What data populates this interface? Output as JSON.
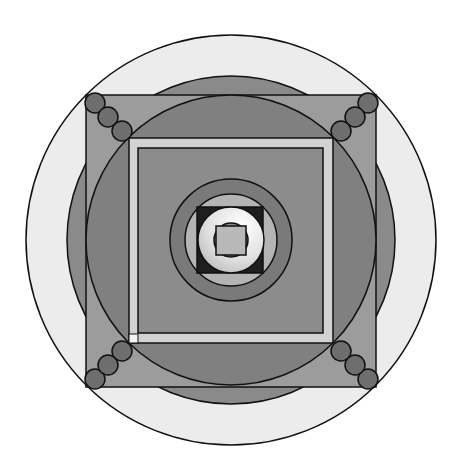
{
  "diagram": {
    "title": "",
    "type": "concentric-geometric-mandala",
    "center": [
      231,
      240
    ],
    "colors": {
      "background": "#ffffff",
      "outer_circle": "#ececec",
      "mid_circle": "#8a8a8a",
      "outer_square": "#9c9c9c",
      "inner_circle": "#808080",
      "frame": "#d2d2d2",
      "frame_inner": "#8c8c8c",
      "ring": "#7a7a7a",
      "light_circle": "#b4b4b4",
      "dark_square": "#1e1e1e",
      "white_ring": "#e6e6e6",
      "core_circle": "#8a8a8a",
      "core_square": "#b8b8b8",
      "corner_dots": "#6e6e6e",
      "stroke": "#111111"
    },
    "shapes": [
      {
        "name": "outer-circle",
        "kind": "circle",
        "r": 205
      },
      {
        "name": "mid-circle",
        "kind": "circle",
        "r": 164
      },
      {
        "name": "outer-square",
        "kind": "square",
        "x": 86,
        "y": 95,
        "w": 290,
        "h": 292
      },
      {
        "name": "inner-circle",
        "kind": "circle",
        "r": 145
      },
      {
        "name": "frame-square",
        "kind": "square",
        "x": 129,
        "y": 138,
        "w": 204,
        "h": 205
      },
      {
        "name": "dark-square",
        "kind": "square",
        "x": 138,
        "y": 148,
        "w": 185,
        "h": 185
      },
      {
        "name": "ring",
        "kind": "circle",
        "r": 61
      },
      {
        "name": "light-circle",
        "kind": "circle",
        "r": 46
      },
      {
        "name": "center-dark-square",
        "kind": "square",
        "x": 197,
        "y": 207,
        "w": 66,
        "h": 66
      },
      {
        "name": "white-ring",
        "kind": "circle",
        "r": 33
      },
      {
        "name": "core-circle",
        "kind": "circle",
        "r": 17
      },
      {
        "name": "core-square",
        "kind": "square",
        "x": 216,
        "y": 226,
        "w": 30,
        "h": 29
      }
    ],
    "corner_dots": {
      "radius": 10,
      "top_left": [
        [
          95,
          103
        ],
        [
          108,
          117
        ],
        [
          122,
          131
        ]
      ],
      "top_right": [
        [
          368,
          103
        ],
        [
          355,
          117
        ],
        [
          341,
          131
        ]
      ],
      "bottom_left": [
        [
          95,
          379
        ],
        [
          108,
          365
        ],
        [
          122,
          351
        ]
      ],
      "bottom_right": [
        [
          368,
          379
        ],
        [
          355,
          365
        ],
        [
          341,
          351
        ]
      ]
    },
    "frame_corner_marker": {
      "x": 129,
      "y": 334,
      "w": 9,
      "h": 9
    }
  }
}
